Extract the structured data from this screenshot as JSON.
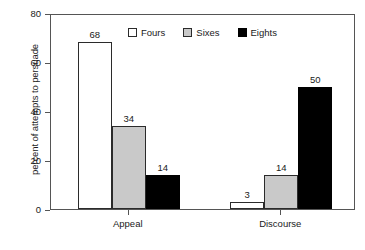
{
  "chart_data": {
    "type": "bar",
    "title": "",
    "xlabel": "",
    "ylabel": "percent of attempts to persuade",
    "categories": [
      "Appeal",
      "Discourse"
    ],
    "series": [
      {
        "name": "Fours",
        "color": "#ffffff",
        "values": [
          68,
          3
        ]
      },
      {
        "name": "Sixes",
        "color": "#c9c9c9",
        "values": [
          34,
          14
        ]
      },
      {
        "name": "Eights",
        "color": "#000000",
        "values": [
          14,
          50
        ]
      }
    ],
    "ylim": [
      0,
      80
    ],
    "yticks": [
      0,
      20,
      40,
      60,
      80
    ],
    "ytick_labels": [
      "0",
      "20",
      "40",
      "60",
      "80"
    ],
    "grid": false,
    "legend_position": "upper center",
    "value_labels": [
      "68",
      "34",
      "14",
      "3",
      "14",
      "50"
    ],
    "bar_outline_color": "#2b2b2b"
  },
  "caption": {
    "fragment": ""
  }
}
